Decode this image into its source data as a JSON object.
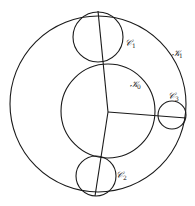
{
  "diagram": {
    "type": "circle-configuration",
    "stroke_color": "#1a1a1a",
    "background": "#ffffff",
    "circles": [
      {
        "id": "K1",
        "label": "𝒦",
        "subscript": "1",
        "cx": 98,
        "cy": 104,
        "r": 88
      },
      {
        "id": "K0",
        "label": "𝒦",
        "subscript": "0",
        "cx": 108,
        "cy": 111,
        "r": 47
      },
      {
        "id": "C1",
        "label": "𝒞",
        "subscript": "1",
        "cx": 98,
        "cy": 37,
        "r": 25
      },
      {
        "id": "C2",
        "label": "𝒞",
        "subscript": "2",
        "cx": 96,
        "cy": 176,
        "r": 20
      },
      {
        "id": "C3",
        "label": "𝒞",
        "subscript": "3",
        "cx": 172,
        "cy": 115,
        "r": 14
      }
    ],
    "hub": {
      "x": 108,
      "y": 112
    },
    "segments": [
      {
        "from": [
          108,
          112
        ],
        "to": [
          98,
          11
        ]
      },
      {
        "from": [
          108,
          112
        ],
        "to": [
          95,
          196
        ]
      },
      {
        "from": [
          108,
          112
        ],
        "to": [
          186,
          118
        ]
      }
    ],
    "labels": {
      "K1": {
        "text": "𝒦",
        "sub": "1",
        "x": 172,
        "y": 56
      },
      "K0": {
        "text": "𝒦",
        "sub": "0",
        "x": 130,
        "y": 87
      },
      "C1": {
        "text": "𝒞",
        "sub": "1",
        "x": 125,
        "y": 46
      },
      "C2": {
        "text": "𝒞",
        "sub": "2",
        "x": 116,
        "y": 178
      },
      "C3": {
        "text": "𝒞",
        "sub": "3",
        "x": 168,
        "y": 99
      }
    }
  }
}
